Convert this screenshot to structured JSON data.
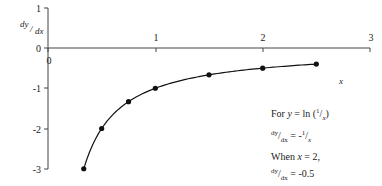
{
  "chart_data": {
    "type": "line",
    "title": "",
    "xlabel": "x",
    "ylabel": "dy/dx",
    "xlim": [
      0,
      3
    ],
    "ylim": [
      -3,
      1
    ],
    "x_ticks": [
      "0",
      "1",
      "2",
      "3"
    ],
    "y_ticks": [
      "1",
      "0",
      "-1",
      "-2",
      "-3"
    ],
    "grid": false,
    "legend": "none",
    "series": [
      {
        "name": "dy/dx = -1/x",
        "x": [
          0.333,
          0.5,
          0.75,
          1.0,
          1.5,
          2.0,
          2.5
        ],
        "y": [
          -3.0,
          -2.0,
          -1.333,
          -1.0,
          -0.667,
          -0.5,
          -0.4
        ],
        "markers": true,
        "smooth": true
      }
    ],
    "annotations": [
      "For y = ln(1/x)",
      "dy/dx = -1/x",
      "When x = 2,",
      "dy/dx = -0.5"
    ]
  },
  "axes": {
    "y_label_top": "dy",
    "y_label_bottom": "dx",
    "x_label": "x",
    "x_ticks": [
      "0",
      "1",
      "2",
      "3"
    ],
    "y_ticks": [
      "1",
      "0",
      "-1",
      "-2",
      "-3"
    ]
  },
  "note": {
    "line1_prefix": "For ",
    "line1_var": "y",
    "line1_eq": " = ln (",
    "line1_num": "1",
    "line1_slash": "/",
    "line1_den": "x",
    "line1_close": ")",
    "line2_num": "dy",
    "line2_slash": "/",
    "line2_den": "dx",
    "line2_eq": " = -",
    "line2_rnum": "1",
    "line2_rslash": "/",
    "line2_rden": "x",
    "line3_prefix": "When ",
    "line3_var": "x",
    "line3_rest": " = 2,",
    "line4_num": "dy",
    "line4_slash": "/",
    "line4_den": "dx",
    "line4_rest": " = -0.5"
  }
}
